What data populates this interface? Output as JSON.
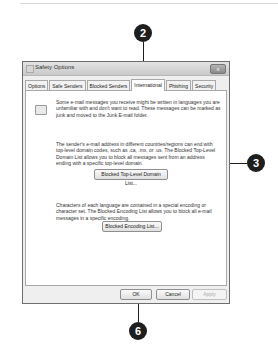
{
  "callouts": [
    {
      "id": "2",
      "label": "2"
    },
    {
      "id": "3",
      "label": "3"
    },
    {
      "id": "6",
      "label": "6"
    }
  ],
  "dialog": {
    "title": "Safety Options",
    "close_label": "x",
    "tabs": [
      {
        "label": "Options",
        "active": false
      },
      {
        "label": "Safe Senders",
        "active": false
      },
      {
        "label": "Blocked Senders",
        "active": false
      },
      {
        "label": "International",
        "active": true
      },
      {
        "label": "Phishing",
        "active": false
      },
      {
        "label": "Security",
        "active": false
      }
    ],
    "international": {
      "intro_text": "Some e-mail messages you receive might be written in languages you are unfamiliar with and don't want to read. These messages can be marked as junk and moved to the Junk E-mail folder.",
      "tld_text": "The sender's e-mail address in different countries/regions can end with top-level domain codes, such as .ca, .mx, or .us. The Blocked Top-Level Domain List allows you to block all messages sent from an address ending with a specific top-level domain.",
      "tld_button": "Blocked Top-Level Domain List...",
      "encoding_text": "Characters of each language are contained in a special encoding or character set. The Blocked Encoding List allows you to block all e-mail messages in a specific encoding.",
      "encoding_button": "Blocked Encoding List..."
    },
    "buttons": {
      "ok": "OK",
      "cancel": "Cancel",
      "apply": "Apply"
    }
  }
}
